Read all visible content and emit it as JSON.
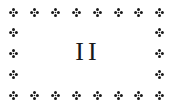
{
  "page": {
    "numeral": "II",
    "ornament_icon": "four-petal-fleuron-icon",
    "ornament_color": "#1a1a1a",
    "background": "#ffffff"
  },
  "border": {
    "columns_x": [
      13,
      34,
      55,
      76,
      97,
      118,
      138,
      159
    ],
    "rows_y": [
      12,
      32,
      53,
      74,
      95
    ]
  }
}
